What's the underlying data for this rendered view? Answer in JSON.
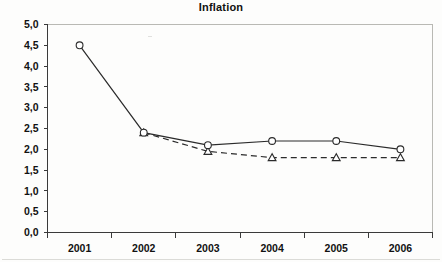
{
  "chart_data": {
    "type": "line",
    "title": "Inflation",
    "xlabel": "",
    "ylabel": "",
    "categories": [
      "2001",
      "2002",
      "2003",
      "2004",
      "2005",
      "2006"
    ],
    "series": [
      {
        "name": "series-1",
        "marker": "circle",
        "line_style": "solid",
        "values": [
          4.5,
          2.4,
          2.1,
          2.2,
          2.2,
          2.0
        ]
      },
      {
        "name": "series-2",
        "marker": "triangle",
        "line_style": "dashed",
        "values": [
          null,
          2.4,
          1.95,
          1.8,
          1.8,
          1.8
        ]
      }
    ],
    "ylim": [
      0.0,
      5.0
    ],
    "ytick_values": [
      0.0,
      0.5,
      1.0,
      1.5,
      2.0,
      2.5,
      3.0,
      3.5,
      4.0,
      4.5,
      5.0
    ],
    "ytick_labels": [
      "0,0",
      "0,5",
      "1,0",
      "1,5",
      "2,0",
      "2,5",
      "3,0",
      "3,5",
      "4,0",
      "4,5",
      "5,0"
    ],
    "xtick_labels": [
      "2001",
      "2002",
      "2003",
      "2004",
      "2005",
      "2006"
    ],
    "grid": false,
    "legend": false,
    "legend_position": "none",
    "decimal_separator": ","
  }
}
